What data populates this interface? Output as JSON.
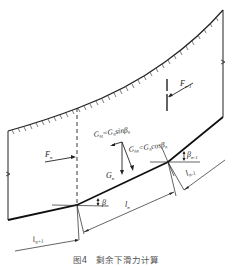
{
  "diagram": {
    "labels": {
      "f_n_minus_1": "F",
      "f_n_minus_1_sub": "n-1",
      "f_n": "F",
      "f_n_sub": "n",
      "g_nt": "G",
      "g_nt_sub": "nt",
      "g_nt_eq": "=G",
      "g_nt_eq_sub": "n",
      "g_nt_func": "sinβ",
      "g_nt_func_sub": "n",
      "g_nn": "G",
      "g_nn_sub": "nn",
      "g_nn_eq": "=G",
      "g_nn_eq_sub": "n",
      "g_nn_func": "cosβ",
      "g_nn_func_sub": "n",
      "g_n": "G",
      "g_n_sub": "n",
      "beta_n": "β",
      "beta_n_sub": "n",
      "beta_n_minus_1": "β",
      "beta_n_minus_1_sub": "n-1",
      "l_n": "l",
      "l_n_sub": "n",
      "l_n_minus_1_right": "l",
      "l_n_minus_1_right_sub": "n-1",
      "l_n_plus_1": "l",
      "l_n_plus_1_sub": "n+1"
    },
    "caption": "图4　剩余下滑力计算"
  }
}
